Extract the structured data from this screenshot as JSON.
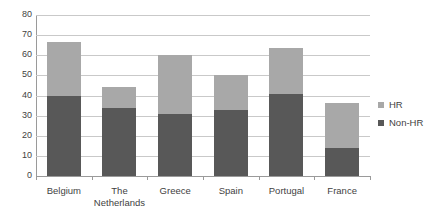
{
  "chart_data": {
    "type": "bar",
    "subtype": "stacked-vertical",
    "title": "",
    "xlabel": "",
    "ylabel": "",
    "ylim": [
      0,
      80
    ],
    "ytick_step": 10,
    "yticks": [
      80,
      70,
      60,
      50,
      40,
      30,
      20,
      10,
      0
    ],
    "grid": true,
    "grid_axis": "y",
    "legend_position": "right",
    "categories": [
      "Belgium",
      "The Netherlands",
      "Greece",
      "Spain",
      "Portugal",
      "France"
    ],
    "series": [
      {
        "name": "Non-HR",
        "color": "#585858",
        "values": [
          40,
          34,
          31,
          33,
          41,
          14
        ]
      },
      {
        "name": "HR",
        "color": "#a8a8a8",
        "values": [
          26.5,
          10,
          29,
          17,
          22.5,
          22.5
        ]
      }
    ],
    "totals": [
      66.5,
      44,
      60,
      50,
      63.5,
      36.5
    ]
  },
  "legend": {
    "items": [
      {
        "label": "HR",
        "color": "#a8a8a8"
      },
      {
        "label": "Non-HR",
        "color": "#585858"
      }
    ]
  },
  "axis": {
    "y_tick_labels": [
      "80",
      "70",
      "60",
      "50",
      "40",
      "30",
      "20",
      "10",
      "0"
    ],
    "x_tick_labels": [
      "Belgium",
      "The\nNetherlands",
      "Greece",
      "Spain",
      "Portugal",
      "France"
    ]
  }
}
